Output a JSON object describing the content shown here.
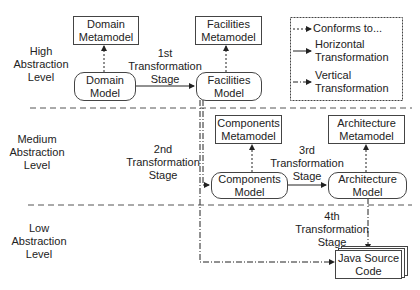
{
  "levels": {
    "high": "High\nAbstraction\nLevel",
    "medium": "Medium\nAbstraction\nLevel",
    "low": "Low\nAbstraction\nLevel"
  },
  "nodes": {
    "domain_metamodel": "Domain\nMetamodel",
    "domain_model": "Domain\nModel",
    "facilities_metamodel": "Facilities\nMetamodel",
    "facilities_model": "Facilities\nModel",
    "components_metamodel": "Components\nMetamodel",
    "components_model": "Components\nModel",
    "architecture_metamodel": "Architecture\nMetamodel",
    "architecture_model": "Architecture\nModel",
    "java_source_code": "Java Source\nCode"
  },
  "stages": {
    "first": "1st\nTransformation\nStage",
    "second": "2nd\nTransformation\nStage",
    "third": "3rd\nTransformation\nStage",
    "fourth": "4th\nTransformation\nStage"
  },
  "legend": {
    "conforms": "Conforms to...",
    "horizontal": "Horizontal\nTransformation",
    "vertical": "Vertical\nTransformation"
  }
}
